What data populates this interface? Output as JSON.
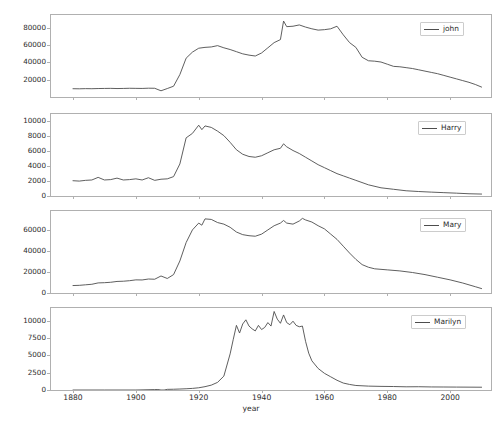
{
  "figure": {
    "xlabel": "year",
    "x_ticks": [
      1880,
      1900,
      1920,
      1940,
      1960,
      1980,
      2000
    ],
    "x_range": [
      1873,
      2013
    ],
    "line_color": "#4d4d4d",
    "frame_color": "#b0b0b0"
  },
  "chart_data": [
    {
      "type": "line",
      "title": "",
      "xlabel": "year",
      "ylabel": "",
      "legend": [
        "john"
      ],
      "legend_position": "upper right",
      "grid": false,
      "xlim": [
        1873,
        2013
      ],
      "ylim": [
        0,
        95000
      ],
      "y_ticks": [
        20000,
        40000,
        60000,
        80000
      ],
      "x": [
        1880,
        1882,
        1884,
        1886,
        1888,
        1890,
        1892,
        1894,
        1896,
        1898,
        1900,
        1902,
        1904,
        1906,
        1908,
        1910,
        1912,
        1914,
        1916,
        1918,
        1920,
        1922,
        1924,
        1926,
        1928,
        1930,
        1932,
        1934,
        1936,
        1938,
        1940,
        1942,
        1944,
        1946,
        1947,
        1948,
        1950,
        1952,
        1954,
        1956,
        1958,
        1960,
        1962,
        1964,
        1966,
        1968,
        1970,
        1972,
        1974,
        1976,
        1978,
        1980,
        1982,
        1984,
        1986,
        1988,
        1990,
        1992,
        1994,
        1996,
        1998,
        2000,
        2002,
        2004,
        2006,
        2008,
        2010
      ],
      "series": [
        {
          "name": "john",
          "values": [
            9600,
            9500,
            9700,
            9600,
            9800,
            9900,
            10000,
            9800,
            9900,
            10100,
            10000,
            9900,
            10200,
            10100,
            7200,
            9800,
            12500,
            26000,
            45000,
            52000,
            56500,
            57500,
            58000,
            59500,
            57000,
            55000,
            52500,
            50000,
            48500,
            47500,
            51000,
            57000,
            63000,
            66500,
            88000,
            81500,
            82000,
            83500,
            81000,
            79000,
            77500,
            78000,
            79000,
            82000,
            72000,
            63000,
            57500,
            46000,
            42000,
            41500,
            40500,
            38000,
            35500,
            35000,
            34000,
            33000,
            31500,
            30000,
            28500,
            27000,
            25000,
            23000,
            21000,
            19000,
            17000,
            14500,
            11500
          ]
        }
      ]
    },
    {
      "type": "line",
      "title": "",
      "xlabel": "year",
      "ylabel": "",
      "legend": [
        "Harry"
      ],
      "legend_position": "upper right",
      "grid": false,
      "xlim": [
        1873,
        2013
      ],
      "ylim": [
        0,
        11000
      ],
      "y_ticks": [
        0,
        2000,
        4000,
        6000,
        8000,
        10000
      ],
      "x": [
        1880,
        1882,
        1884,
        1886,
        1888,
        1890,
        1892,
        1894,
        1896,
        1898,
        1900,
        1902,
        1904,
        1906,
        1908,
        1910,
        1912,
        1914,
        1916,
        1918,
        1920,
        1921,
        1922,
        1924,
        1926,
        1928,
        1930,
        1932,
        1934,
        1936,
        1938,
        1940,
        1942,
        1944,
        1946,
        1947,
        1948,
        1950,
        1952,
        1954,
        1956,
        1958,
        1960,
        1962,
        1964,
        1966,
        1968,
        1970,
        1974,
        1978,
        1982,
        1986,
        1990,
        1994,
        1998,
        2002,
        2006,
        2010
      ],
      "series": [
        {
          "name": "Harry",
          "values": [
            2050,
            2000,
            2100,
            2150,
            2500,
            2150,
            2200,
            2400,
            2150,
            2200,
            2300,
            2150,
            2450,
            2100,
            2250,
            2300,
            2600,
            4300,
            7800,
            8400,
            9500,
            8900,
            9400,
            9200,
            8700,
            8100,
            7200,
            6200,
            5600,
            5300,
            5200,
            5400,
            5800,
            6200,
            6400,
            7000,
            6600,
            6100,
            5700,
            5200,
            4700,
            4200,
            3800,
            3400,
            3000,
            2700,
            2400,
            2100,
            1500,
            1100,
            900,
            700,
            600,
            520,
            450,
            380,
            300,
            260
          ]
        }
      ]
    },
    {
      "type": "line",
      "title": "",
      "xlabel": "year",
      "ylabel": "",
      "legend": [
        "Mary"
      ],
      "legend_position": "upper right",
      "grid": false,
      "xlim": [
        1873,
        2013
      ],
      "ylim": [
        0,
        78000
      ],
      "y_ticks": [
        0,
        20000,
        40000,
        60000
      ],
      "x": [
        1880,
        1882,
        1884,
        1886,
        1888,
        1890,
        1892,
        1894,
        1896,
        1898,
        1900,
        1902,
        1904,
        1906,
        1908,
        1910,
        1912,
        1914,
        1916,
        1918,
        1920,
        1921,
        1922,
        1924,
        1926,
        1928,
        1930,
        1932,
        1934,
        1936,
        1938,
        1940,
        1942,
        1944,
        1946,
        1947,
        1948,
        1950,
        1952,
        1953,
        1954,
        1956,
        1958,
        1960,
        1962,
        1964,
        1966,
        1968,
        1970,
        1972,
        1974,
        1976,
        1980,
        1984,
        1988,
        1992,
        1996,
        2000,
        2004,
        2008,
        2010
      ],
      "values_note": "",
      "series": [
        {
          "name": "Mary",
          "values": [
            7100,
            7300,
            7800,
            8300,
            9600,
            9800,
            10200,
            11000,
            11200,
            11700,
            12500,
            12400,
            13300,
            13100,
            16200,
            13800,
            17500,
            30500,
            48000,
            60000,
            66500,
            64500,
            70500,
            70000,
            67000,
            65500,
            62500,
            58000,
            55500,
            54500,
            54000,
            56000,
            60000,
            64000,
            66500,
            69000,
            66500,
            65500,
            68500,
            71000,
            69500,
            67500,
            64000,
            61000,
            56000,
            51000,
            44500,
            38000,
            32000,
            27000,
            24500,
            23000,
            22000,
            21000,
            19500,
            17500,
            15000,
            12500,
            9500,
            6000,
            4200
          ]
        }
      ]
    },
    {
      "type": "line",
      "title": "",
      "xlabel": "year",
      "ylabel": "",
      "legend": [
        "Marilyn"
      ],
      "legend_position": "upper right",
      "grid": false,
      "xlim": [
        1873,
        2013
      ],
      "ylim": [
        0,
        11800
      ],
      "y_ticks": [
        0,
        2500,
        5000,
        7500,
        10000
      ],
      "x": [
        1880,
        1890,
        1900,
        1906,
        1907,
        1908,
        1909,
        1910,
        1912,
        1914,
        1916,
        1918,
        1920,
        1922,
        1924,
        1926,
        1928,
        1930,
        1931,
        1932,
        1933,
        1934,
        1935,
        1936,
        1937,
        1938,
        1939,
        1940,
        1941,
        1942,
        1943,
        1944,
        1945,
        1946,
        1947,
        1948,
        1949,
        1950,
        1951,
        1952,
        1953,
        1954,
        1955,
        1956,
        1958,
        1960,
        1962,
        1964,
        1966,
        1968,
        1970,
        1974,
        1978,
        1982,
        1986,
        1990,
        1994,
        1998,
        2002,
        2006,
        2010
      ],
      "series": [
        {
          "name": "Marilyn",
          "values": [
            0,
            0,
            0,
            60,
            70,
            0,
            0,
            90,
            110,
            140,
            180,
            230,
            320,
            480,
            700,
            1100,
            2000,
            5200,
            7300,
            9300,
            8200,
            9500,
            10100,
            9200,
            8800,
            8500,
            9300,
            8700,
            9000,
            9700,
            9200,
            11300,
            10200,
            9600,
            10800,
            9700,
            9400,
            9900,
            9300,
            9100,
            9200,
            7000,
            5300,
            4200,
            3100,
            2400,
            1900,
            1400,
            1000,
            800,
            650,
            560,
            520,
            500,
            460,
            470,
            440,
            430,
            420,
            410,
            400
          ]
        }
      ]
    }
  ]
}
